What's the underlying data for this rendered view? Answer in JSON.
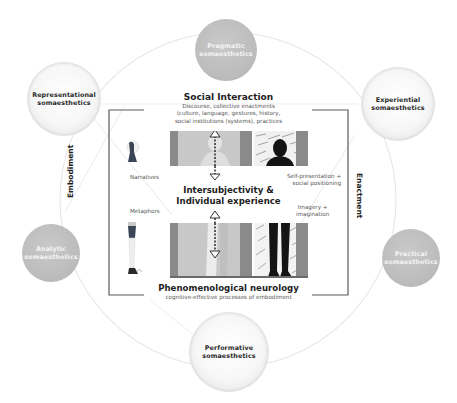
{
  "figure": {
    "colors": {
      "grey_node": "#bdbdbd",
      "glass_node": "#f4f4f4",
      "ring": "#e4e4e4",
      "bracket": "#5a5a5a",
      "panel_light_grey": "#c8c8c8",
      "panel_dark_grey": "#8a8a8a",
      "silhouette": "#141414",
      "text": "#1e1e1e",
      "subtext": "#555555"
    },
    "nodes": [
      {
        "id": "pragmatic",
        "line1": "Pragmatic",
        "line2": "somaesthetics",
        "style": "grey"
      },
      {
        "id": "representational",
        "line1": "Representational",
        "line2": "somaesthetics",
        "style": "glass"
      },
      {
        "id": "experiential",
        "line1": "Experiential",
        "line2": "somaesthetics",
        "style": "glass"
      },
      {
        "id": "analytic",
        "line1": "Analytic",
        "line2": "somaesthetics",
        "style": "grey"
      },
      {
        "id": "practical",
        "line1": "Practical",
        "line2": "somaesthetics",
        "style": "grey"
      },
      {
        "id": "performative",
        "line1": "Performative",
        "line2": "somaesthetics",
        "style": "glass"
      }
    ],
    "top": {
      "title": "Social Interaction",
      "line1": "Discourse, collective enactments",
      "line2": "(culture, language, gestures, history,",
      "line3": "social institutions (systems), practices"
    },
    "center": {
      "line1": "Intersubjectivity &",
      "line2": "Individual experience"
    },
    "bottom": {
      "title": "Phenomenological neurology",
      "subtitle": "cognitive-effective processes of embodiment"
    },
    "left_axis": "Embodiment",
    "right_axis": "Enactment",
    "left_labels": {
      "upper": "Narratives",
      "lower": "Metaphors"
    },
    "right_labels": {
      "upper_line1": "Self-presentation +",
      "upper_line2": "social positioning",
      "lower_line1": "Imagery +",
      "lower_line2": "imagination"
    }
  }
}
